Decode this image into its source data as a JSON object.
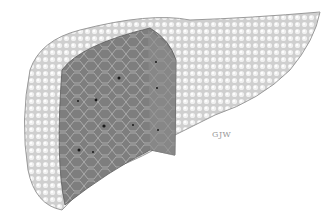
{
  "illustration": {
    "subject": "cirrhotic liver cross-section",
    "signature": "GJW",
    "colors": {
      "surface": "#d8d8d8",
      "nodule_highlight": "#f2f2f2",
      "cut_face": "#7a7a7a",
      "cut_face_light": "#9a9a9a",
      "septa": "#bdbdbd",
      "vessel": "#1a1a1a",
      "background": "#ffffff"
    }
  }
}
